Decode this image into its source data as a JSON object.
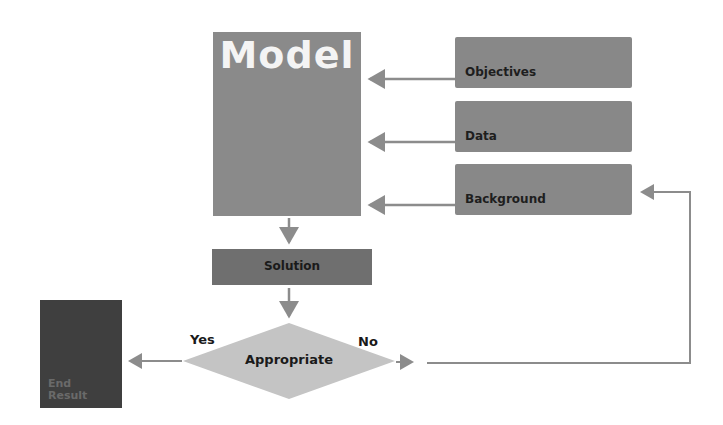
{
  "diagram": {
    "model": {
      "label": "Model"
    },
    "inputs": [
      {
        "label": "Objectives"
      },
      {
        "label": "Data"
      },
      {
        "label": "Background"
      }
    ],
    "solution": {
      "label": "Solution"
    },
    "decision": {
      "label": "Appropriate",
      "yes_label": "Yes",
      "no_label": "No"
    },
    "end": {
      "label_line1": "End",
      "label_line2": "Result"
    },
    "colors": {
      "model": "#8a8a8a",
      "inputs": "#888888",
      "solution": "#6f6f6f",
      "decision": "#c4c4c4",
      "end": "#3f3f3f",
      "arrows": "#8c8c8c"
    }
  }
}
